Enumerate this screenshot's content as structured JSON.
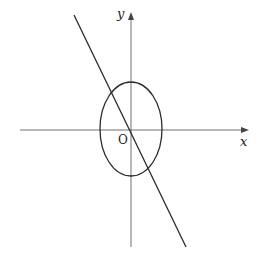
{
  "diagram": {
    "type": "coordinate-plane",
    "axes": {
      "x_label": "x",
      "y_label": "y",
      "origin_label": "O"
    },
    "shapes": [
      {
        "kind": "ellipse",
        "center": "O",
        "description": "ellipse centered at origin, vertical major axis"
      },
      {
        "kind": "line",
        "description": "line through origin with negative slope"
      }
    ]
  },
  "colors": {
    "axis": "#707070",
    "curve": "#2a2a2a",
    "background": "#ffffff"
  }
}
